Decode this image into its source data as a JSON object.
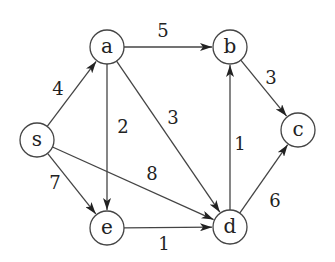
{
  "graph": {
    "type": "directed-weighted-graph",
    "nodes": [
      {
        "id": "s",
        "label": "s",
        "x": 37,
        "y": 140
      },
      {
        "id": "a",
        "label": "a",
        "x": 107,
        "y": 47
      },
      {
        "id": "b",
        "label": "b",
        "x": 230,
        "y": 47
      },
      {
        "id": "c",
        "label": "c",
        "x": 298,
        "y": 130
      },
      {
        "id": "e",
        "label": "e",
        "x": 107,
        "y": 228
      },
      {
        "id": "d",
        "label": "d",
        "x": 230,
        "y": 227
      }
    ],
    "edges": [
      {
        "from": "s",
        "to": "a",
        "weight": "4",
        "lx": 58,
        "ly": 88
      },
      {
        "from": "a",
        "to": "b",
        "weight": "5",
        "lx": 163,
        "ly": 30
      },
      {
        "from": "a",
        "to": "e",
        "weight": "2",
        "lx": 123,
        "ly": 126
      },
      {
        "from": "a",
        "to": "d",
        "weight": "3",
        "lx": 173,
        "ly": 117
      },
      {
        "from": "s",
        "to": "d",
        "weight": "8",
        "lx": 152,
        "ly": 173
      },
      {
        "from": "s",
        "to": "e",
        "weight": "7",
        "lx": 55,
        "ly": 182
      },
      {
        "from": "e",
        "to": "d",
        "weight": "1",
        "lx": 164,
        "ly": 243
      },
      {
        "from": "d",
        "to": "b",
        "weight": "1",
        "lx": 240,
        "ly": 143
      },
      {
        "from": "b",
        "to": "c",
        "weight": "3",
        "lx": 271,
        "ly": 77
      },
      {
        "from": "d",
        "to": "c",
        "weight": "6",
        "lx": 275,
        "ly": 200
      }
    ],
    "node_radius": 17,
    "stroke_color": "#444444",
    "text_color": "#222222"
  }
}
